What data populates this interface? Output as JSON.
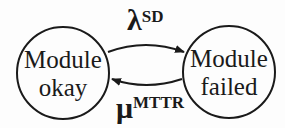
{
  "diagram": {
    "type": "state-transition",
    "colors": {
      "stroke": "#1a1a1a",
      "background": "#fdfdfd"
    },
    "nodes": [
      {
        "id": "okay",
        "line1": "Module",
        "line2": "okay"
      },
      {
        "id": "failed",
        "line1": "Module",
        "line2": "failed"
      }
    ],
    "edges": [
      {
        "from": "okay",
        "to": "failed",
        "symbol": "λ",
        "superscript": "SD"
      },
      {
        "from": "failed",
        "to": "okay",
        "symbol": "μ",
        "superscript": "MTTR"
      }
    ]
  }
}
